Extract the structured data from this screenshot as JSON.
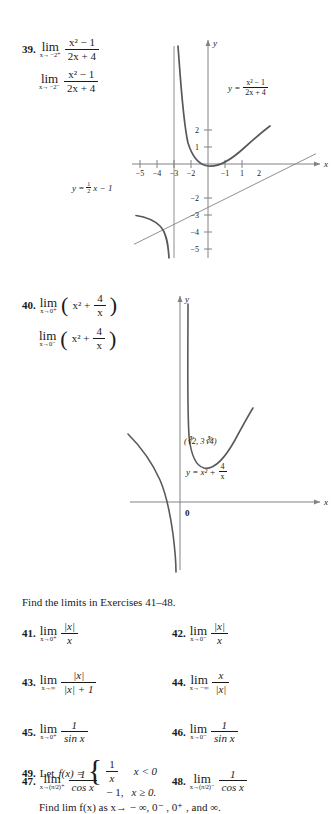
{
  "page": {
    "background": "#ffffff",
    "ink": "#1a1a1a",
    "curve_color": "#58595b",
    "axis_color": "#808285"
  },
  "exercise_39": {
    "number": "39.",
    "limit1": {
      "op": "lim",
      "sub": "x→ −2⁺",
      "numerator": "x² − 1",
      "denominator": "2x + 4"
    },
    "limit2": {
      "op": "lim",
      "sub": "x→ −2⁻",
      "numerator": "x² − 1",
      "denominator": "2x + 4"
    }
  },
  "figure_39": {
    "axis_label_x": "x",
    "axis_label_y": "y",
    "x_ticks": [
      "−5",
      "−4",
      "−3",
      "−2",
      "−1",
      "1",
      "2"
    ],
    "y_ticks": [
      "2",
      "1",
      "−2",
      "−3",
      "−4",
      "−5"
    ],
    "curve_label": {
      "lhs": "y =",
      "numerator": "x² − 1",
      "denominator": "2x + 4"
    },
    "asymptote_label": "y = ½x − 1",
    "asymptote_label_parts": {
      "lhs": "y =",
      "frac_top": "1",
      "frac_bottom": "2",
      "rest": "x − 1"
    },
    "vertical_asymptote_x": "−2"
  },
  "exercise_40": {
    "number": "40.",
    "limit1": {
      "op": "lim",
      "sub": "x→0⁺",
      "expr_lead": "x² +",
      "frac_top": "4",
      "frac_bottom": "x"
    },
    "limit2": {
      "op": "lim",
      "sub": "x→0⁻",
      "expr_lead": "x² +",
      "frac_top": "4",
      "frac_bottom": "x"
    }
  },
  "figure_40": {
    "axis_label_x": "x",
    "axis_label_y": "y",
    "origin_label": "0",
    "min_point_label": "(∛2, 3∛4)",
    "curve_label": {
      "lhs": "y = x² +",
      "frac_top": "4",
      "frac_bottom": "x"
    }
  },
  "instruction": "Find the limits in Exercises 41–48.",
  "exercises": [
    {
      "number": "41.",
      "op": "lim",
      "sub": "x→0⁺",
      "num_type": "abs_x",
      "numerator": "|x|",
      "denominator": "x"
    },
    {
      "number": "42.",
      "op": "lim",
      "sub": "x→0⁻",
      "num_type": "abs_x",
      "numerator": "|x|",
      "denominator": "x"
    },
    {
      "number": "43.",
      "op": "lim",
      "sub": "x→∞",
      "num_type": "abs_x",
      "numerator": "|x|",
      "denominator": "|x| + 1"
    },
    {
      "number": "44.",
      "op": "lim",
      "sub": "x→ −∞",
      "num_type": "plain",
      "numerator": "x",
      "denominator": "|x|"
    },
    {
      "number": "45.",
      "op": "lim",
      "sub": "x→0⁺",
      "num_type": "plain",
      "numerator": "1",
      "denominator": "sin x"
    },
    {
      "number": "46.",
      "op": "lim",
      "sub": "x→0⁻",
      "num_type": "plain",
      "numerator": "1",
      "denominator": "sin x"
    },
    {
      "number": "47.",
      "op": "lim",
      "sub": "x→(π/2)⁺",
      "num_type": "plain",
      "numerator": "1",
      "denominator": "cos x"
    },
    {
      "number": "48.",
      "op": "lim",
      "sub": "x→(π/2)⁻",
      "num_type": "plain",
      "numerator": "1",
      "denominator": "cos x"
    }
  ],
  "exercise_49": {
    "number": "49.",
    "lead": "Let",
    "fx": "f(x) =",
    "case1_frac_top": "1",
    "case1_frac_bottom": "x",
    "case1_cond": "x < 0",
    "case2_value": "− 1,",
    "case2_cond": "x ≥ 0.",
    "closing": "Find lim f(x) as x→ − ∞, 0⁻ , 0⁺ , and ∞."
  }
}
